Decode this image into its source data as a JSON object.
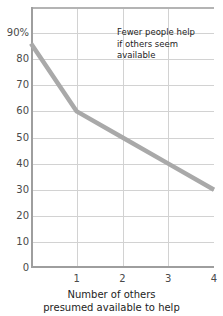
{
  "chart_data": {
    "type": "line",
    "title": "",
    "subtitle": "",
    "xlabel_lines": [
      "Number of others",
      "presumed available to help"
    ],
    "ylabel": "",
    "x": [
      0,
      1,
      2,
      3,
      4
    ],
    "values": [
      86,
      60,
      50,
      40,
      30
    ],
    "series": [
      {
        "name": "Percent who help",
        "values": [
          86,
          60,
          50,
          40,
          30
        ],
        "color": "#a9a9a9"
      }
    ],
    "xlim": [
      0,
      4
    ],
    "ylim": [
      0,
      100
    ],
    "x_ticks": [
      1,
      2,
      3,
      4
    ],
    "x_tick_labels": [
      "1",
      "2",
      "3",
      "4"
    ],
    "y_ticks": [
      0,
      10,
      20,
      30,
      40,
      50,
      60,
      70,
      80,
      90
    ],
    "y_tick_labels": [
      "0",
      "10",
      "20",
      "30",
      "40",
      "50",
      "60",
      "70",
      "80",
      "90%"
    ],
    "grid": "both",
    "legend": "none",
    "annotations": [
      {
        "lines": [
          "Fewer people help",
          "if others seem",
          "available"
        ],
        "x": 1.9,
        "y": 92
      }
    ],
    "colors": {
      "line": "#a9a9a9",
      "gridline": "#d2d2d2",
      "axis": "#9e9e9e",
      "text": "#1d1d1d",
      "tick_text": "#4a4a4a",
      "background": "#ffffff"
    }
  }
}
